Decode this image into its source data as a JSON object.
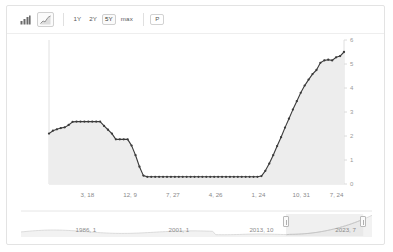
{
  "toolbar": {
    "chart_type_buttons": [
      {
        "name": "bar-chart-icon",
        "label": "bar",
        "selected": false
      },
      {
        "name": "line-chart-icon",
        "label": "line",
        "selected": true
      }
    ],
    "range_buttons": [
      {
        "label": "1Y",
        "selected": false
      },
      {
        "label": "2Y",
        "selected": false
      },
      {
        "label": "5Y",
        "selected": true
      },
      {
        "label": "max",
        "selected": false
      }
    ],
    "print_button": {
      "label": "P"
    }
  },
  "colors": {
    "line": "#3b3b3b",
    "fill": "#ededed",
    "axis": "#e0e0e0",
    "tick_text": "#8a8a8a",
    "card_border": "#e3e3e3",
    "navigator_fill": "#e8e8e8"
  },
  "navigator": {
    "labels": [
      "1986, 1",
      "2001, 1",
      "2013, 10",
      "2023, 7"
    ],
    "label_positions": [
      0.185,
      0.45,
      0.685,
      0.925
    ],
    "selection": {
      "start": 0.755,
      "end": 0.975
    }
  },
  "chart_data": {
    "type": "area",
    "title": "",
    "xlabel": "",
    "ylabel": "",
    "ylim": [
      0,
      6
    ],
    "yticks": [
      0,
      1,
      2,
      3,
      4,
      5,
      6
    ],
    "ytick_labels": [
      "0",
      "1",
      "2",
      "3",
      "4",
      "5",
      "6"
    ],
    "grid": false,
    "legend": "none",
    "xtick_labels": [
      "3, 18",
      "12, 9",
      "7, 27",
      "4, 26",
      "1, 24",
      "10, 31",
      "7, 24"
    ],
    "xtick_positions": [
      0.13,
      0.275,
      0.42,
      0.565,
      0.71,
      0.855,
      0.975
    ],
    "values": [
      2.1,
      2.22,
      2.28,
      2.33,
      2.36,
      2.46,
      2.59,
      2.6,
      2.6,
      2.6,
      2.6,
      2.6,
      2.6,
      2.6,
      2.42,
      2.26,
      2.1,
      1.86,
      1.86,
      1.86,
      1.86,
      1.6,
      1.2,
      0.72,
      0.35,
      0.3,
      0.3,
      0.3,
      0.3,
      0.3,
      0.3,
      0.3,
      0.3,
      0.3,
      0.3,
      0.3,
      0.3,
      0.3,
      0.3,
      0.3,
      0.3,
      0.3,
      0.3,
      0.3,
      0.3,
      0.3,
      0.3,
      0.3,
      0.3,
      0.3,
      0.3,
      0.3,
      0.3,
      0.3,
      0.33,
      0.55,
      0.85,
      1.2,
      1.58,
      1.95,
      2.35,
      2.72,
      3.1,
      3.45,
      3.8,
      4.1,
      4.35,
      4.58,
      4.75,
      5.05,
      5.15,
      5.18,
      5.15,
      5.28,
      5.33,
      5.5
    ]
  }
}
